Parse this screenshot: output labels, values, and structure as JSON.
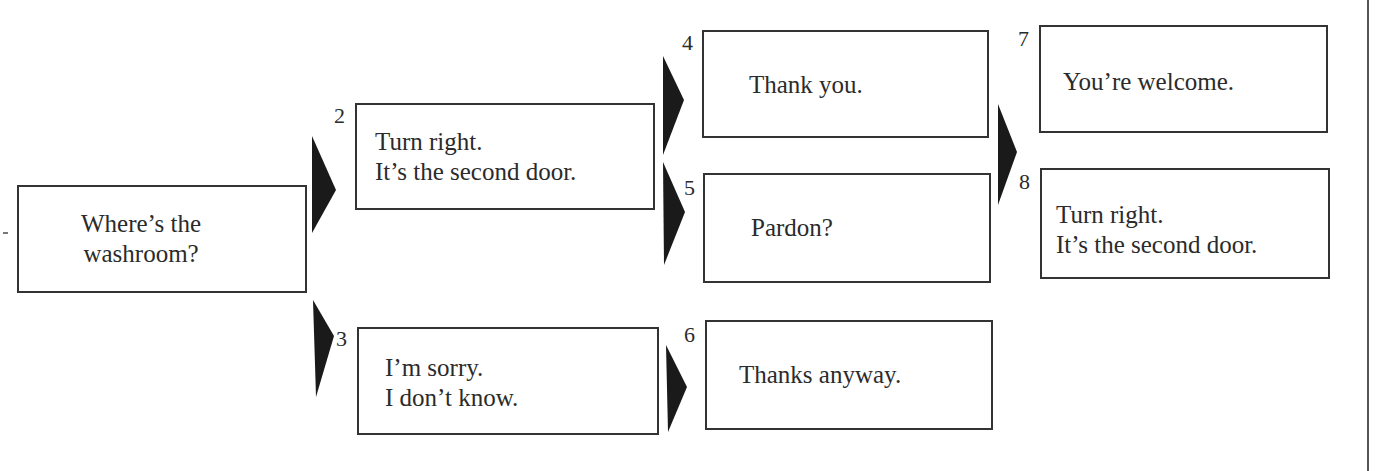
{
  "diagram": {
    "type": "dialogue-flowchart",
    "nodes": [
      {
        "id": 1,
        "number": "",
        "lines": "Where’s the\nwashroom?"
      },
      {
        "id": 2,
        "number": "2",
        "lines": "Turn right.\nIt’s the second door."
      },
      {
        "id": 3,
        "number": "3",
        "lines": "I’m sorry.\nI don’t know."
      },
      {
        "id": 4,
        "number": "4",
        "lines": "Thank you."
      },
      {
        "id": 5,
        "number": "5",
        "lines": "Pardon?"
      },
      {
        "id": 6,
        "number": "6",
        "lines": "Thanks anyway."
      },
      {
        "id": 7,
        "number": "7",
        "lines": "You’re welcome."
      },
      {
        "id": 8,
        "number": "8",
        "lines": "Turn right.\nIt’s the second door."
      }
    ],
    "edges": [
      {
        "from": 1,
        "to": 2
      },
      {
        "from": 1,
        "to": 3
      },
      {
        "from": 2,
        "to": 4
      },
      {
        "from": 2,
        "to": 5
      },
      {
        "from": 3,
        "to": 6
      },
      {
        "from": 4,
        "to": 7
      },
      {
        "from": 5,
        "to": 8
      }
    ],
    "colors": {
      "stroke": "#333333",
      "arrow": "#1a1a1a",
      "background": "#ffffff"
    }
  }
}
